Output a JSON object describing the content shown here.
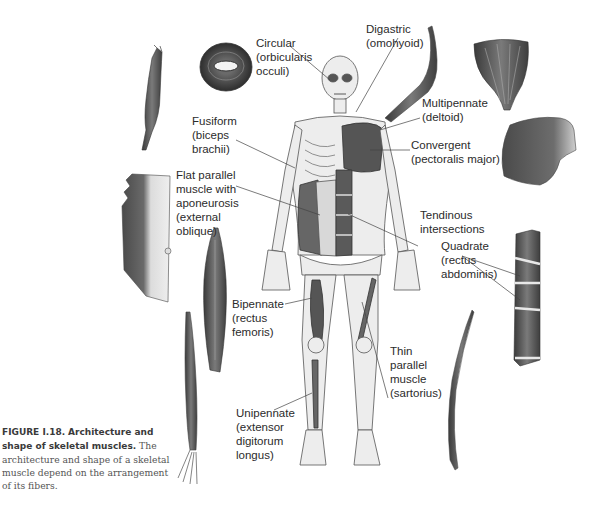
{
  "figure": {
    "number": "FIGURE I.18.",
    "title": "Architecture and shape of skeletal muscles.",
    "body": "The architecture and shape of a skeletal muscle depend on the arrangement of its fibers."
  },
  "labels": [
    {
      "id": "circular",
      "lines": "Circular\n(orbicularis\nocculi)"
    },
    {
      "id": "digastric",
      "lines": "Digastric\n(omohyoid)"
    },
    {
      "id": "fusiform",
      "lines": "Fusiform\n(biceps\nbrachii)"
    },
    {
      "id": "multipennate",
      "lines": "Multipennate\n(deltoid)"
    },
    {
      "id": "convergent",
      "lines": "Convergent\n(pectoralis major)"
    },
    {
      "id": "flat-parallel",
      "lines": "Flat parallel\nmuscle with\naponeurosis\n(external\noblique)"
    },
    {
      "id": "tendinous",
      "lines": "Tendinous\nintersections"
    },
    {
      "id": "quadrate",
      "lines": "Quadrate\n(rectus\nabdominis)"
    },
    {
      "id": "bipennate",
      "lines": "Bipennate\n(rectus\nfemoris)"
    },
    {
      "id": "thin-parallel",
      "lines": "Thin\nparallel\nmuscle\n(sartorius)"
    },
    {
      "id": "unipennate",
      "lines": "Unipennate\n(extensor\ndigitorum\nlongus)"
    }
  ],
  "colors": {
    "muscle_dark": "#4a4a4a",
    "muscle_mid": "#8a8a8a",
    "bone": "#e6e6e6",
    "outline": "#555555",
    "leader": "#444444",
    "text": "#2b2b2b"
  }
}
